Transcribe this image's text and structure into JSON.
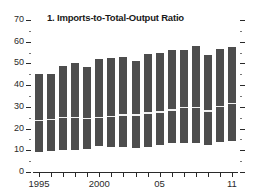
{
  "chart_data": {
    "type": "bar",
    "title": "1. Imports-to-Total-Output Ratio",
    "xlabel": "",
    "ylabel": "",
    "ylim": [
      0,
      70
    ],
    "xlim": [
      1994.5,
      2011.5
    ],
    "grid": false,
    "legend": null,
    "orientation": "vertical",
    "bar_style": "floating-range-bar-with-internal-divider",
    "bar_color": "#4d4d4d",
    "divider_color": "#f2f2f2",
    "background_color": "#ffffff",
    "y_ticks_major": [
      0,
      10,
      20,
      30,
      40,
      50,
      60,
      70
    ],
    "y_tick_labels": [
      "0",
      "10",
      "20",
      "30",
      "40",
      "50",
      "60",
      "70"
    ],
    "y_ticks_minor": [
      5,
      15,
      25,
      35,
      45,
      55,
      65
    ],
    "x_tick_years": [
      1995,
      1996,
      1997,
      1998,
      1999,
      2000,
      2001,
      2002,
      2003,
      2004,
      2005,
      2006,
      2007,
      2008,
      2009,
      2010,
      2011
    ],
    "x_tick_labels": [
      {
        "year": 1995,
        "label": "1995"
      },
      {
        "year": 2000,
        "label": "2000"
      },
      {
        "year": 2005,
        "label": "05"
      },
      {
        "year": 2011,
        "label": "11"
      }
    ],
    "categories": [
      "1995",
      "1996",
      "1997",
      "1998",
      "1999",
      "2000",
      "2001",
      "2002",
      "2003",
      "2004",
      "2005",
      "2006",
      "2007",
      "2008",
      "2009",
      "2010",
      "2011"
    ],
    "series": [
      {
        "name": "Range low",
        "values": [
          9,
          9.5,
          10,
          10,
          10.5,
          12,
          11.5,
          11.5,
          11,
          11.5,
          12.5,
          13.5,
          13.5,
          13.5,
          12.5,
          14,
          14.5
        ]
      },
      {
        "name": "Median divider",
        "values": [
          24,
          24.5,
          25.5,
          25.5,
          25,
          25.5,
          26,
          26.5,
          26.5,
          27.5,
          28,
          29,
          30,
          30,
          28.5,
          30.5,
          32
        ]
      },
      {
        "name": "Range high",
        "values": [
          45,
          45,
          49,
          50,
          48.5,
          52,
          52.5,
          53,
          51,
          54.5,
          55,
          56,
          56,
          58,
          54,
          56.5,
          57.5
        ]
      }
    ]
  }
}
